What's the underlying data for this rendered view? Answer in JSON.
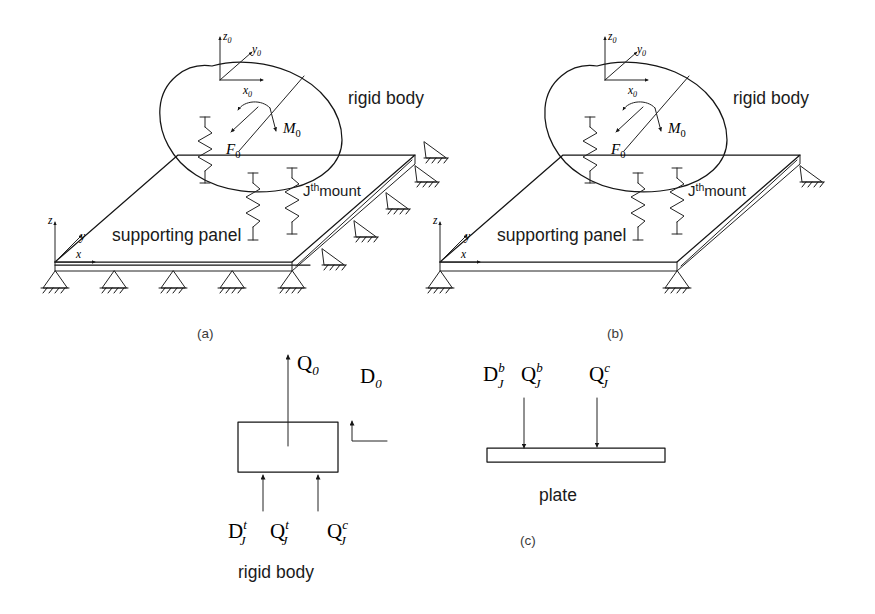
{
  "figure": {
    "background_color": "#ffffff",
    "ink_color": "#151515"
  },
  "panel_a": {
    "caption": "(a)",
    "body_label": "rigid body",
    "panel_label": "supporting panel",
    "mount_label": "J",
    "mount_label_sup": "th",
    "mount_label_tail": "mount",
    "local_axes": {
      "z": "z",
      "z_sub": "0",
      "y": "y",
      "y_sub": "0",
      "x": "x",
      "x_sub": "0"
    },
    "global_axes": {
      "z": "z",
      "y": "y",
      "x": "x"
    },
    "force_label": "F",
    "force_sub": "0",
    "moment_label": "M",
    "moment_sub": "0",
    "edge_supports_front": 5,
    "edge_supports_right": 4,
    "mounts": 3
  },
  "panel_b": {
    "caption": "(b)",
    "body_label": "rigid body",
    "panel_label": "supporting panel",
    "mount_label": "J",
    "mount_label_sup": "th",
    "mount_label_tail": "mount",
    "local_axes": {
      "z": "z",
      "z_sub": "0",
      "y": "y",
      "y_sub": "0",
      "x": "x",
      "x_sub": "0"
    },
    "global_axes": {
      "z": "z",
      "y": "y",
      "x": "x"
    },
    "force_label": "F",
    "force_sub": "0",
    "moment_label": "M",
    "moment_sub": "0",
    "edge_supports_front": 2,
    "edge_supports_right": 2,
    "mounts": 3
  },
  "panel_c": {
    "caption": "(c)",
    "rigid_body_label": "rigid body",
    "plate_label": "plate",
    "body_force_top": {
      "sym": "Q",
      "sub": "0"
    },
    "body_disp_top": {
      "sym": "D",
      "sub": "0"
    },
    "body_bottom_labels": [
      {
        "sym": "D",
        "sub": "J",
        "sup": "t"
      },
      {
        "sym": "Q",
        "sub": "J",
        "sup": "t"
      },
      {
        "sym": "Q",
        "sub": "J",
        "sup": "c"
      }
    ],
    "plate_top_labels": [
      {
        "sym": "D",
        "sub": "J",
        "sup": "b"
      },
      {
        "sym": "Q",
        "sub": "J",
        "sup": "b"
      },
      {
        "sym": "Q",
        "sub": "J",
        "sup": "c"
      }
    ]
  }
}
